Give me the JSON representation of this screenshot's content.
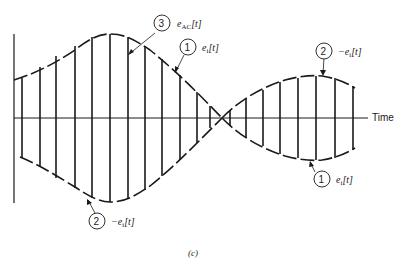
{
  "figure": {
    "caption": "(c)",
    "axis": {
      "x_label": "Time"
    },
    "callouts": [
      {
        "number": "3",
        "label_main": "e",
        "label_sub": "AC",
        "label_tail": "[t]"
      },
      {
        "number": "1",
        "label_main": "e",
        "label_sub": "i",
        "label_tail": "[t]"
      },
      {
        "number": "2",
        "label_main": "−e",
        "label_sub": "i",
        "label_tail": "[t]"
      },
      {
        "number": "1",
        "label_main": "e",
        "label_sub": "i",
        "label_tail": "[t]"
      },
      {
        "number": "2",
        "label_main": "−e",
        "label_sub": "i",
        "label_tail": "[t]"
      }
    ],
    "colors": {
      "ink": "#1a1a1a",
      "background": "#ffffff"
    }
  }
}
